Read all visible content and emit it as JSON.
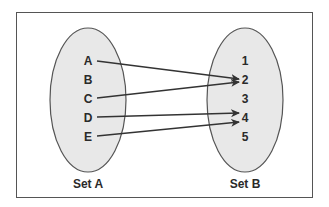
{
  "diagram": {
    "type": "set-mapping",
    "colors": {
      "ellipse_fill": "#e8e8e8",
      "ellipse_stroke": "#555555",
      "arrow": "#333333",
      "text": "#2a2a2a",
      "frame": "#555555"
    },
    "set_a": {
      "label": "Set A",
      "elements": [
        "A",
        "B",
        "C",
        "D",
        "E"
      ]
    },
    "set_b": {
      "label": "Set B",
      "elements": [
        "1",
        "2",
        "3",
        "4",
        "5"
      ]
    },
    "mappings": [
      {
        "from": "A",
        "to": "2"
      },
      {
        "from": "C",
        "to": "2"
      },
      {
        "from": "D",
        "to": "4"
      },
      {
        "from": "E",
        "to": "4"
      }
    ]
  }
}
